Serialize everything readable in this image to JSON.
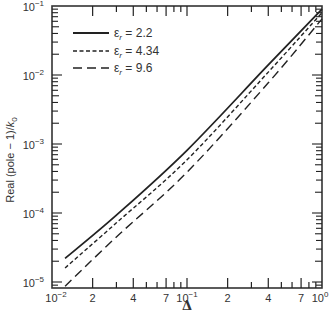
{
  "chart_data": {
    "type": "line",
    "title": "",
    "xlabel": "Δ",
    "ylabel": "Real (pole − 1)/k₀",
    "xscale": "log",
    "yscale": "log",
    "xlim": [
      0.01,
      1
    ],
    "ylim": [
      8e-06,
      0.1
    ],
    "grid": false,
    "legend_position": "upper left",
    "x_ticks": {
      "major": [
        {
          "value": 0.01,
          "label": "10",
          "exp": "−2"
        },
        {
          "value": 0.1,
          "label": "10",
          "exp": "−1"
        },
        {
          "value": 1,
          "label": "10",
          "exp": "0"
        }
      ],
      "minor_labeled": [
        {
          "value": 0.02,
          "label": "2"
        },
        {
          "value": 0.04,
          "label": "4"
        },
        {
          "value": 0.07,
          "label": "7"
        },
        {
          "value": 0.2,
          "label": "2"
        },
        {
          "value": 0.4,
          "label": "4"
        },
        {
          "value": 0.7,
          "label": "7"
        }
      ]
    },
    "y_ticks": [
      {
        "value": 0.1,
        "label": "10",
        "exp": "−1"
      },
      {
        "value": 0.01,
        "label": "10",
        "exp": "−2"
      },
      {
        "value": 0.001,
        "label": "10",
        "exp": "−3"
      },
      {
        "value": 0.0001,
        "label": "10",
        "exp": "−4"
      },
      {
        "value": 1e-05,
        "label": "10",
        "exp": "−5"
      }
    ],
    "x": [
      0.0125,
      0.03,
      0.1,
      0.4,
      1.0
    ],
    "series": [
      {
        "name": "εr = 2.2",
        "style": "solid",
        "values": [
          2.2e-05,
          9.3e-05,
          0.00081,
          0.014,
          0.09
        ]
      },
      {
        "name": "εr = 4.34",
        "style": "short-dash",
        "values": [
          1.6e-05,
          7.2e-05,
          0.00059,
          0.011,
          0.08
        ]
      },
      {
        "name": "εr = 9.6",
        "style": "long-dash",
        "values": [
          8.7e-06,
          4.5e-05,
          0.00039,
          0.0077,
          0.065
        ]
      }
    ]
  },
  "legend": [
    {
      "symbol": "ε",
      "sub": "r",
      "value": "= 2.2"
    },
    {
      "symbol": "ε",
      "sub": "r",
      "value": "= 4.34"
    },
    {
      "symbol": "ε",
      "sub": "r",
      "value": "= 9.6"
    }
  ],
  "colors": {
    "line": "#222222",
    "axis": "#333333",
    "background": "#ffffff"
  }
}
